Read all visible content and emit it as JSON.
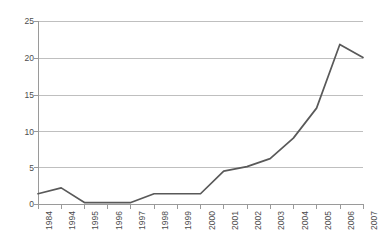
{
  "chart_data": {
    "type": "line",
    "title": "",
    "subtitle": "",
    "xlabel": "",
    "ylabel": "",
    "categories": [
      "1984",
      "1994",
      "1995",
      "1996",
      "1997",
      "1998",
      "1999",
      "2000",
      "2001",
      "2002",
      "2003",
      "2004",
      "2005",
      "2006",
      "2007"
    ],
    "values": [
      1.4,
      2.2,
      0.2,
      0.2,
      0.2,
      1.4,
      1.4,
      1.4,
      4.5,
      5.1,
      6.2,
      9.0,
      13.1,
      21.8,
      20.0
    ],
    "series": [
      {
        "name": "",
        "values": [
          1.4,
          2.2,
          0.2,
          0.2,
          0.2,
          1.4,
          1.4,
          1.4,
          4.5,
          5.1,
          6.2,
          9.0,
          13.1,
          21.8,
          20.0
        ]
      }
    ],
    "ylim": [
      0,
      25
    ],
    "yticks": [
      0,
      5,
      10,
      15,
      20,
      25
    ],
    "ytick_labels": [
      "0",
      "5",
      "10",
      "15",
      "20",
      "25"
    ],
    "grid": "horizontal",
    "legend": "none",
    "line_color": "#595959",
    "gridline_color": "#bfbfbf",
    "axis_color": "#9a9a9a",
    "background_color": "#ffffff",
    "annotations": []
  },
  "axes": {
    "y": {
      "tick_0": "0",
      "tick_1": "5",
      "tick_2": "10",
      "tick_3": "15",
      "tick_4": "20",
      "tick_5": "25"
    },
    "x": {
      "tick_0": "1984",
      "tick_1": "1994",
      "tick_2": "1995",
      "tick_3": "1996",
      "tick_4": "1997",
      "tick_5": "1998",
      "tick_6": "1999",
      "tick_7": "2000",
      "tick_8": "2001",
      "tick_9": "2002",
      "tick_10": "2003",
      "tick_11": "2004",
      "tick_12": "2005",
      "tick_13": "2006",
      "tick_14": "2007"
    }
  }
}
